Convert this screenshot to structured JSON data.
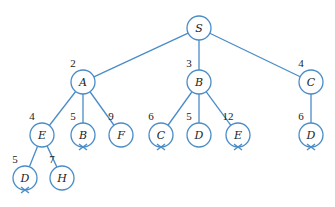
{
  "diagram": {
    "type": "search-tree",
    "colors": {
      "line": "#4a8cc7",
      "text": "#222222",
      "background": "#ffffff"
    },
    "node_radius": 12,
    "nodes": [
      {
        "id": "S",
        "label": "S",
        "cost": "",
        "x": 199,
        "y": 28,
        "pruned": false
      },
      {
        "id": "A",
        "label": "A",
        "cost": "2",
        "x": 83,
        "y": 82,
        "pruned": false
      },
      {
        "id": "B",
        "label": "B",
        "cost": "3",
        "x": 199,
        "y": 82,
        "pruned": false
      },
      {
        "id": "C",
        "label": "C",
        "cost": "4",
        "x": 311,
        "y": 82,
        "pruned": false
      },
      {
        "id": "AE",
        "label": "E",
        "cost": "4",
        "x": 42,
        "y": 135,
        "pruned": false
      },
      {
        "id": "AB",
        "label": "B",
        "cost": "5",
        "x": 83,
        "y": 135,
        "pruned": true
      },
      {
        "id": "AF",
        "label": "F",
        "cost": "9",
        "x": 121,
        "y": 135,
        "pruned": false
      },
      {
        "id": "BC",
        "label": "C",
        "cost": "6",
        "x": 161,
        "y": 135,
        "pruned": true
      },
      {
        "id": "BD",
        "label": "D",
        "cost": "5",
        "x": 199,
        "y": 135,
        "pruned": false
      },
      {
        "id": "BE",
        "label": "E",
        "cost": "12",
        "x": 238,
        "y": 135,
        "pruned": true
      },
      {
        "id": "CD",
        "label": "D",
        "cost": "6",
        "x": 311,
        "y": 135,
        "pruned": true
      },
      {
        "id": "AED",
        "label": "D",
        "cost": "5",
        "x": 25,
        "y": 178,
        "pruned": true
      },
      {
        "id": "AEH",
        "label": "H",
        "cost": "7",
        "x": 62,
        "y": 178,
        "pruned": false
      }
    ],
    "edges": [
      [
        "S",
        "A"
      ],
      [
        "S",
        "B"
      ],
      [
        "S",
        "C"
      ],
      [
        "A",
        "AE"
      ],
      [
        "A",
        "AB"
      ],
      [
        "A",
        "AF"
      ],
      [
        "B",
        "BC"
      ],
      [
        "B",
        "BD"
      ],
      [
        "B",
        "BE"
      ],
      [
        "C",
        "CD"
      ],
      [
        "AE",
        "AED"
      ],
      [
        "AE",
        "AEH"
      ]
    ]
  }
}
